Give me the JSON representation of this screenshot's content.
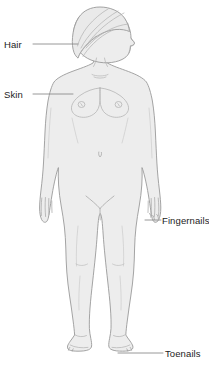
{
  "diagram": {
    "background_color": "#ffffff",
    "body_fill_color": "#ededed",
    "body_outline_color": "#9a9a9a",
    "detail_line_color": "#b5b5b5",
    "leader_line_color": "#8c8c8c",
    "label_text_color": "#1c1c1c",
    "labels": [
      {
        "id": "hair",
        "text": "Hair",
        "side": "left",
        "target_part": "hair-on-head",
        "leader_from_x": 33,
        "leader_to_x": 78,
        "leader_y": 44
      },
      {
        "id": "skin",
        "text": "Skin",
        "side": "left",
        "target_part": "upper-arm-skin",
        "leader_from_x": 33,
        "leader_to_x": 73,
        "leader_y": 94
      },
      {
        "id": "fingernails",
        "text": "Fingernails",
        "side": "right",
        "target_part": "left-hand-fingers",
        "leader_from_x": 147,
        "leader_to_x": 161,
        "leader_y": 220
      },
      {
        "id": "toenails",
        "text": "Toenails",
        "side": "right",
        "target_part": "left-foot-toes",
        "leader_from_x": 120,
        "leader_to_x": 163,
        "leader_y": 353
      }
    ],
    "body_parts": [
      "hair",
      "head",
      "face-profile",
      "neck",
      "left-shoulder",
      "right-shoulder",
      "chest",
      "left-breast",
      "right-breast",
      "navel",
      "left-arm",
      "right-arm",
      "left-hand",
      "right-hand",
      "fingernails",
      "hips",
      "left-leg",
      "right-leg",
      "left-knee",
      "right-knee",
      "left-foot",
      "right-foot",
      "toenails"
    ]
  }
}
